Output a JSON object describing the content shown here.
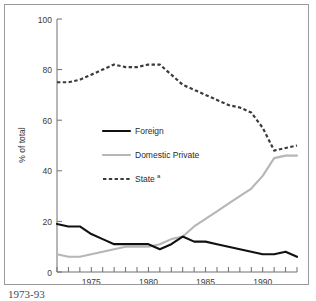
{
  "chart_data": {
    "type": "line",
    "title": "",
    "xlabel": "",
    "ylabel": "% of total",
    "xlim": [
      1972,
      1993
    ],
    "ylim": [
      0,
      100
    ],
    "grid": false,
    "legend_position": "center-left",
    "x": [
      1972,
      1973,
      1974,
      1975,
      1976,
      1977,
      1978,
      1979,
      1980,
      1981,
      1982,
      1983,
      1984,
      1985,
      1986,
      1987,
      1988,
      1989,
      1990,
      1991,
      1992,
      1993
    ],
    "xticks": [
      1975,
      1980,
      1985,
      1990
    ],
    "xticklabels": [
      "1975",
      "1980",
      "1985",
      "1990"
    ],
    "yticks": [
      0,
      20,
      40,
      60,
      80,
      100
    ],
    "yticklabels": [
      "0",
      "20",
      "40",
      "60",
      "80",
      "100"
    ],
    "series": [
      {
        "name": "Foreign",
        "color": "#111111",
        "style": "solid",
        "values": [
          19,
          18,
          18,
          15,
          13,
          11,
          11,
          11,
          11,
          9,
          11,
          14,
          12,
          12,
          11,
          10,
          9,
          8,
          7,
          7,
          8,
          6
        ]
      },
      {
        "name": "Domestic Private",
        "color": "#b6b6b6",
        "style": "solid",
        "values": [
          7,
          6,
          6,
          7,
          8,
          9,
          10,
          10,
          10,
          11,
          13,
          14,
          18,
          21,
          24,
          27,
          30,
          33,
          38,
          45,
          46,
          46
        ]
      },
      {
        "name": "State",
        "color": "#3b3b3b",
        "style": "dashed",
        "superscript": "a",
        "values": [
          75,
          75,
          76,
          78,
          80,
          82,
          81,
          81,
          82,
          82,
          78,
          74,
          72,
          70,
          68,
          66,
          65,
          63,
          57,
          48,
          49,
          50
        ]
      }
    ]
  },
  "legend": {
    "items": [
      {
        "label": "Foreign",
        "superscript": ""
      },
      {
        "label": "Domestic Private",
        "superscript": ""
      },
      {
        "label": "State",
        "superscript": "a"
      }
    ]
  },
  "axis": {
    "y_title": "% of total"
  },
  "caption": {
    "text": "1973-93"
  }
}
